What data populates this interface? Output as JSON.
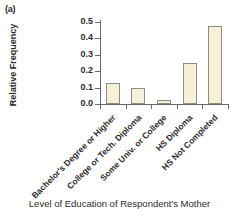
{
  "panel": {
    "label": "(a)"
  },
  "chart_data": {
    "type": "bar",
    "title": "",
    "xlabel": "Level of Education of Respondent's Mother",
    "ylabel": "Relative Frequency",
    "categories": [
      "Bachelor's Degree or Higher",
      "College or Tech. Diploma",
      "Some Univ. or College",
      "HS Diploma",
      "HS Not Completed"
    ],
    "values": [
      0.13,
      0.1,
      0.025,
      0.25,
      0.475
    ],
    "ylim": [
      0.0,
      0.5
    ],
    "ytick_labels": [
      "0.0",
      "0.1",
      "0.2",
      "0.3",
      "0.4",
      "0.5"
    ],
    "ytick_values": [
      0.0,
      0.1,
      0.2,
      0.3,
      0.4,
      0.5
    ],
    "grid": false,
    "legend": "none",
    "bar_fill_color": "#f5f0d7",
    "bar_border_color": "#8d8d85",
    "axis_color": "#6a6a6a",
    "text_color": "#2b2b2b"
  }
}
